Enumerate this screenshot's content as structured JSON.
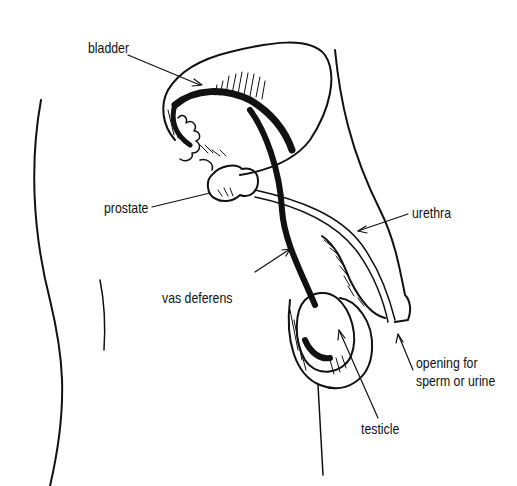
{
  "diagram": {
    "labels": {
      "bladder": "bladder",
      "prostate": "prostate",
      "urethra": "urethra",
      "vas_deferens": "vas deferens",
      "opening_line1": "opening for",
      "opening_line2": "sperm or urine",
      "testicle": "testicle"
    },
    "colors": {
      "ink": "#111111",
      "background": "#ffffff"
    }
  }
}
